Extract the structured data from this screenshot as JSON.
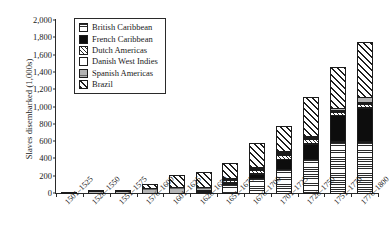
{
  "chart_data": {
    "type": "bar",
    "subtype": "stacked-bar",
    "title": "",
    "xlabel": "",
    "ylabel": "Slaves disembarked (1,000s)",
    "ylim": [
      0,
      2000
    ],
    "yticks": [
      "0",
      "200",
      "400",
      "600",
      "800",
      "1,000",
      "1,200",
      "1,400",
      "1,600",
      "1,800",
      "2,000"
    ],
    "ytick_values": [
      0,
      200,
      400,
      600,
      800,
      1000,
      1200,
      1400,
      1600,
      1800,
      2000
    ],
    "grid": false,
    "legend_position": "top-left-inside",
    "categories": [
      "1501–1525",
      "1526–1550",
      "1551–1575",
      "1576–1600",
      "1601–1625",
      "1626–1650",
      "1651–1675",
      "1676–1700",
      "1701–1725",
      "1726–1750",
      "1751–1775",
      "1776–1800"
    ],
    "stack_order_bottom_to_top": [
      "British Caribbean",
      "French Caribbean",
      "Dutch Americas",
      "Danish West Indies",
      "Spanish Americas",
      "Brazil"
    ],
    "series": [
      {
        "name": "British Caribbean",
        "pattern": "horizontal-lines",
        "values": [
          0,
          0,
          0,
          0,
          0,
          5,
          115,
          180,
          280,
          400,
          600,
          600
        ]
      },
      {
        "name": "French Caribbean",
        "pattern": "solid-black",
        "values": [
          0,
          0,
          0,
          0,
          0,
          0,
          25,
          55,
          125,
          185,
          310,
          400
        ]
      },
      {
        "name": "Dutch Americas",
        "pattern": "cross-hatch",
        "values": [
          0,
          0,
          0,
          0,
          0,
          10,
          35,
          55,
          60,
          60,
          50,
          50
        ]
      },
      {
        "name": "Danish West Indies",
        "pattern": "white",
        "values": [
          0,
          0,
          0,
          0,
          0,
          0,
          0,
          5,
          10,
          15,
          20,
          20
        ]
      },
      {
        "name": "Spanish Americas",
        "pattern": "gray-fine-lines",
        "values": [
          5,
          30,
          30,
          60,
          75,
          40,
          20,
          20,
          20,
          25,
          35,
          70
        ]
      },
      {
        "name": "Brazil",
        "pattern": "diagonal-hatch",
        "values": [
          0,
          3,
          5,
          55,
          150,
          190,
          185,
          285,
          305,
          455,
          475,
          640
        ]
      }
    ],
    "totals": [
      5,
      33,
      35,
      115,
      225,
      245,
      380,
      600,
      800,
      1140,
      1490,
      1780
    ]
  },
  "legend": {
    "items": [
      {
        "label": "British Caribbean"
      },
      {
        "label": "French Caribbean"
      },
      {
        "label": "Dutch Americas"
      },
      {
        "label": "Danish West Indies"
      },
      {
        "label": "Spanish Americas"
      },
      {
        "label": "Brazil"
      }
    ]
  }
}
